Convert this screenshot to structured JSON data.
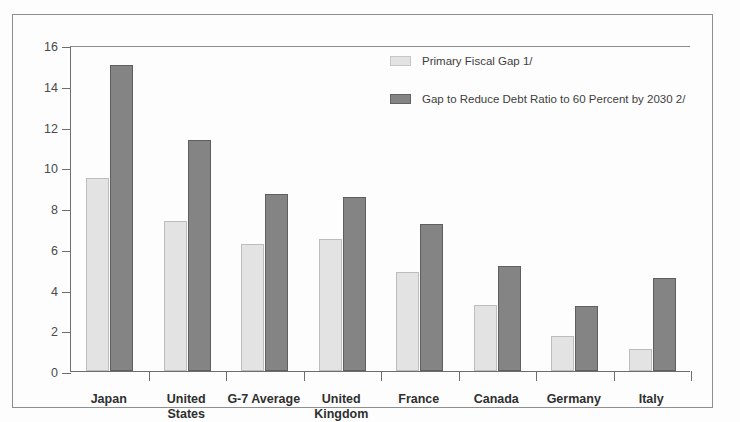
{
  "chart_data": {
    "type": "bar",
    "title": "",
    "xlabel": "",
    "ylabel": "",
    "ylim": [
      0,
      16
    ],
    "yticks": [
      0,
      2,
      4,
      6,
      8,
      10,
      12,
      14,
      16
    ],
    "grid": false,
    "legend_position": "top-center-right",
    "categories": [
      "Japan",
      "United\nStates",
      "G-7 Average",
      "United\nKingdom",
      "France",
      "Canada",
      "Germany",
      "Italy"
    ],
    "series": [
      {
        "name": "Primary Fiscal Gap 1/",
        "color": "#e3e3e3",
        "values": [
          9.45,
          7.35,
          6.25,
          6.5,
          4.85,
          3.25,
          1.7,
          1.1
        ]
      },
      {
        "name": "Gap to Reduce Debt Ratio to 60 Percent by 2030 2/",
        "color": "#848484",
        "values": [
          15.0,
          11.35,
          8.7,
          8.55,
          7.2,
          5.15,
          3.2,
          4.55
        ]
      }
    ]
  },
  "legend": {
    "items": [
      {
        "label": "Primary Fiscal Gap 1/",
        "swatch": "light"
      },
      {
        "label": "Gap to Reduce Debt Ratio to 60 Percent by 2030 2/",
        "swatch": "dark"
      }
    ]
  },
  "axis": {
    "y_tick_labels": [
      "16",
      "14",
      "12",
      "10",
      "8",
      "6",
      "4",
      "2",
      "0"
    ]
  }
}
